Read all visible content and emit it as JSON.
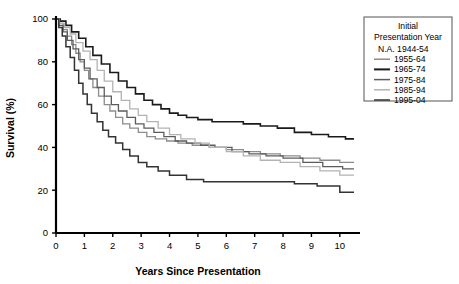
{
  "chart_data": {
    "type": "line",
    "title": "",
    "subtitle": "",
    "xlabel": "Years Since Presentation",
    "ylabel": "Survival (%)",
    "xlim": [
      0,
      10.5
    ],
    "ylim": [
      0,
      100
    ],
    "xticks": [
      0,
      1,
      2,
      3,
      4,
      5,
      6,
      7,
      8,
      9,
      10
    ],
    "xtick_labels": [
      "0",
      "1",
      "2",
      "3",
      "4",
      "5",
      "6",
      "7",
      "8",
      "9",
      "10"
    ],
    "yticks": [
      0,
      20,
      40,
      60,
      80,
      100
    ],
    "ytick_labels": [
      "0",
      "20",
      "40",
      "60",
      "80",
      "100"
    ],
    "grid": false,
    "step_style": "post",
    "legend_position": "outside-top-right",
    "legend_title_line1": "Initial",
    "legend_title_line2": "Presentation Year",
    "series": [
      {
        "name": "1944-54",
        "label": "N.A. 1944-54",
        "swatch": false,
        "color": "#999999",
        "width": 1.0,
        "x": [],
        "y": []
      },
      {
        "name": "1955-64",
        "label": "1955-64",
        "swatch": true,
        "color": "#8c8c8c",
        "width": 1.3,
        "x": [
          0,
          0.1,
          0.25,
          0.4,
          0.55,
          0.7,
          0.85,
          1.0,
          1.15,
          1.3,
          1.5,
          1.7,
          1.9,
          2.1,
          2.35,
          2.6,
          2.9,
          3.2,
          3.5,
          3.9,
          4.3,
          4.8,
          5.4,
          6.0,
          6.6,
          7.2,
          7.9,
          8.6,
          9.3,
          10.0,
          10.5
        ],
        "y": [
          100,
          98,
          95,
          92,
          88,
          84,
          80,
          76,
          72,
          68,
          64,
          60,
          57,
          54,
          51,
          49,
          47,
          45,
          44,
          43,
          42,
          41,
          40,
          39,
          38,
          37,
          36,
          35,
          34,
          33,
          33
        ]
      },
      {
        "name": "1965-74",
        "label": "1965-74",
        "swatch": true,
        "color": "#1a1a1a",
        "width": 1.6,
        "x": [
          0,
          0.15,
          0.35,
          0.55,
          0.8,
          1.05,
          1.3,
          1.6,
          1.9,
          2.2,
          2.5,
          2.8,
          3.1,
          3.4,
          3.7,
          4.0,
          4.3,
          4.6,
          5.0,
          5.5,
          6.0,
          6.6,
          7.2,
          7.8,
          8.4,
          9.0,
          9.6,
          10.2,
          10.5
        ],
        "y": [
          100,
          99,
          97,
          94,
          91,
          87,
          83,
          79,
          75,
          71,
          68,
          65,
          62,
          60,
          58,
          56,
          55,
          54,
          53,
          52,
          52,
          51,
          50,
          49,
          47,
          46,
          45,
          44,
          44
        ]
      },
      {
        "name": "1975-84",
        "label": "1975-84",
        "swatch": true,
        "color": "#5c5c5c",
        "width": 1.3,
        "x": [
          0,
          0.1,
          0.25,
          0.4,
          0.6,
          0.8,
          1.0,
          1.2,
          1.45,
          1.7,
          1.95,
          2.2,
          2.5,
          2.8,
          3.1,
          3.45,
          3.8,
          4.2,
          4.6,
          5.1,
          5.6,
          6.2,
          6.8,
          7.4,
          8.0,
          8.7,
          9.4,
          10.1,
          10.5
        ],
        "y": [
          100,
          97,
          94,
          90,
          86,
          81,
          77,
          72,
          68,
          64,
          60,
          57,
          54,
          51,
          49,
          47,
          45,
          43,
          42,
          41,
          40,
          38,
          37,
          36,
          35,
          33,
          31,
          30,
          30
        ]
      },
      {
        "name": "1985-94",
        "label": "1985-94",
        "swatch": true,
        "color": "#b3b3b3",
        "width": 1.3,
        "x": [
          0,
          0.12,
          0.3,
          0.5,
          0.7,
          0.95,
          1.2,
          1.45,
          1.7,
          2.0,
          2.3,
          2.6,
          2.9,
          3.2,
          3.6,
          4.0,
          4.4,
          4.9,
          5.4,
          6.0,
          6.6,
          7.2,
          7.9,
          8.6,
          9.3,
          10.0,
          10.5
        ],
        "y": [
          100,
          98,
          96,
          93,
          89,
          85,
          81,
          76,
          71,
          66,
          62,
          58,
          55,
          52,
          49,
          46,
          44,
          42,
          40,
          38,
          36,
          34,
          33,
          31,
          29,
          27,
          27
        ]
      },
      {
        "name": "1995-04",
        "label": "1995-04",
        "swatch": true,
        "color": "#333333",
        "width": 1.5,
        "x": [
          0,
          0.1,
          0.22,
          0.35,
          0.5,
          0.65,
          0.8,
          0.95,
          1.1,
          1.25,
          1.45,
          1.65,
          1.85,
          2.1,
          2.35,
          2.6,
          2.9,
          3.2,
          3.6,
          4.0,
          4.6,
          5.2,
          6.0,
          6.8,
          7.6,
          8.4,
          9.2,
          10.0,
          10.5
        ],
        "y": [
          100,
          96,
          92,
          87,
          82,
          76,
          70,
          65,
          60,
          56,
          52,
          48,
          45,
          42,
          39,
          36,
          33,
          31,
          29,
          27,
          25,
          24,
          24,
          24,
          24,
          23,
          22,
          19,
          19
        ]
      }
    ]
  },
  "legend": {
    "title_line1": "Initial",
    "title_line2": "Presentation Year",
    "entries": [
      {
        "label": "N.A. 1944-54",
        "color": "#999999",
        "has_swatch": false
      },
      {
        "label": "1955-64",
        "color": "#8c8c8c",
        "has_swatch": true
      },
      {
        "label": "1965-74",
        "color": "#1a1a1a",
        "has_swatch": true
      },
      {
        "label": "1975-84",
        "color": "#5c5c5c",
        "has_swatch": true
      },
      {
        "label": "1985-94",
        "color": "#b3b3b3",
        "has_swatch": true
      },
      {
        "label": "1995-04",
        "color": "#333333",
        "has_swatch": true
      }
    ]
  },
  "colors": {
    "axis": "#000000",
    "background": "#ffffff",
    "legend_border": "#555555"
  }
}
